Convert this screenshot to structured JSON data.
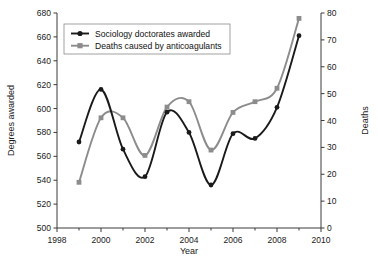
{
  "chart_data": {
    "type": "line",
    "title": "",
    "xlabel": "Year",
    "ylabel": "Degrees awarded",
    "y2label": "Deaths",
    "x": [
      1999,
      2000,
      2001,
      2002,
      2003,
      2004,
      2005,
      2006,
      2007,
      2008,
      2009
    ],
    "xlim": [
      1998,
      2010
    ],
    "xticks": [
      1998,
      2000,
      2002,
      2004,
      2006,
      2008,
      2010
    ],
    "xtick_labels": [
      "1998",
      "2000",
      "2002",
      "2004",
      "2006",
      "2008",
      "2010"
    ],
    "xminor_ticks": [
      1999,
      2001,
      2003,
      2005,
      2007,
      2009
    ],
    "ylim": [
      500,
      680
    ],
    "yticks": [
      500,
      520,
      540,
      560,
      580,
      600,
      620,
      640,
      660,
      680
    ],
    "ytick_labels": [
      "500",
      "520",
      "540",
      "560",
      "580",
      "600",
      "620",
      "640",
      "660",
      "680"
    ],
    "y2lim": [
      0,
      80
    ],
    "y2ticks": [
      0,
      10,
      20,
      30,
      40,
      50,
      60,
      70,
      80
    ],
    "y2tick_labels": [
      "0",
      "10",
      "20",
      "30",
      "40",
      "50",
      "60",
      "70",
      "80"
    ],
    "grid": false,
    "legend_position": "top-left",
    "series": [
      {
        "name": "Sociology doctorates awarded",
        "axis": "left",
        "color": "#1a1a1a",
        "marker": "circle",
        "values": [
          572,
          616,
          566,
          543,
          597,
          580,
          536,
          579,
          575,
          601,
          661
        ]
      },
      {
        "name": "Deaths caused by anticoagulants",
        "axis": "right",
        "color": "#8c8c8c",
        "marker": "square",
        "values": [
          17,
          41,
          41,
          27,
          45,
          47,
          29,
          43,
          47,
          52,
          78
        ]
      }
    ]
  },
  "legend": {
    "entries": [
      {
        "label": "Sociology doctorates awarded",
        "marker": "circle-marker",
        "color": "#1a1a1a"
      },
      {
        "label": "Deaths caused by anticoagulants",
        "marker": "square-marker",
        "color": "#8c8c8c"
      }
    ]
  }
}
